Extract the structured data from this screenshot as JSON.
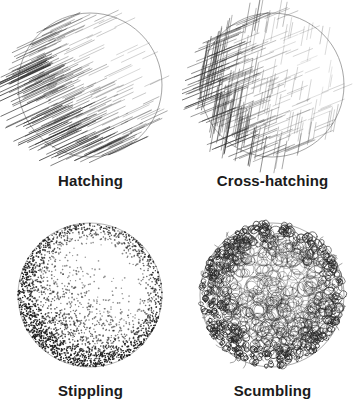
{
  "figure": {
    "background_color": "#ffffff",
    "ink_color": "#2b2b2b",
    "outline_color": "#8a8a8a",
    "label_color": "#1b1b1b",
    "columns": 2,
    "rows": 2
  },
  "panels": [
    {
      "id": "hatching",
      "label": "Hatching",
      "position": "top-left",
      "sphere": {
        "cx": 90,
        "cy": 85,
        "r": 72,
        "light_from": "upper-right",
        "shadow_side": "lower-left"
      },
      "technique": {
        "type": "hatching",
        "description": "Parallel diagonal strokes, one direction only",
        "stroke_angle_deg": 25,
        "stroke_count": 430,
        "stroke_color": "#2f2f2f",
        "stroke_width": 0.55,
        "density": "graded dark at lower-left rim to none at upper-right highlight"
      }
    },
    {
      "id": "cross-hatching",
      "label": "Cross-hatching",
      "position": "top-right",
      "sphere": {
        "cx": 90,
        "cy": 85,
        "r": 72,
        "light_from": "upper-right",
        "shadow_side": "left"
      },
      "technique": {
        "type": "cross-hatching",
        "description": "Two sets of crossing strokes forming a mesh",
        "stroke_angle_deg": [
          22,
          80
        ],
        "stroke_count": 620,
        "stroke_color": "#2f2f2f",
        "stroke_width": 0.5,
        "density": "densest at left rim, mesh thins toward right highlight"
      }
    },
    {
      "id": "stippling",
      "label": "Stippling",
      "position": "bottom-left",
      "sphere": {
        "cx": 90,
        "cy": 85,
        "r": 72,
        "light_from": "center-right",
        "shadow_side": "rim and lower-left"
      },
      "technique": {
        "type": "stippling",
        "description": "Tonal value built entirely from small dots",
        "dot_count": 5200,
        "dot_radius": 0.62,
        "dot_color": "#202020",
        "density": "dense along outer rim and lower-left, sparse in central highlight"
      }
    },
    {
      "id": "scumbling",
      "label": "Scumbling",
      "position": "bottom-right",
      "sphere": {
        "cx": 90,
        "cy": 85,
        "r": 72,
        "light_from": "center",
        "shadow_side": "outer rim, strongest lower-left"
      },
      "technique": {
        "type": "scumbling",
        "description": "Random overlapping scribbled loops",
        "loop_count": 1250,
        "loop_size_center": 9,
        "loop_size_rim": 3,
        "stroke_color": "#262626",
        "stroke_width": 0.55,
        "density": "large open loops in centre, tight dark loops at rim"
      }
    }
  ]
}
